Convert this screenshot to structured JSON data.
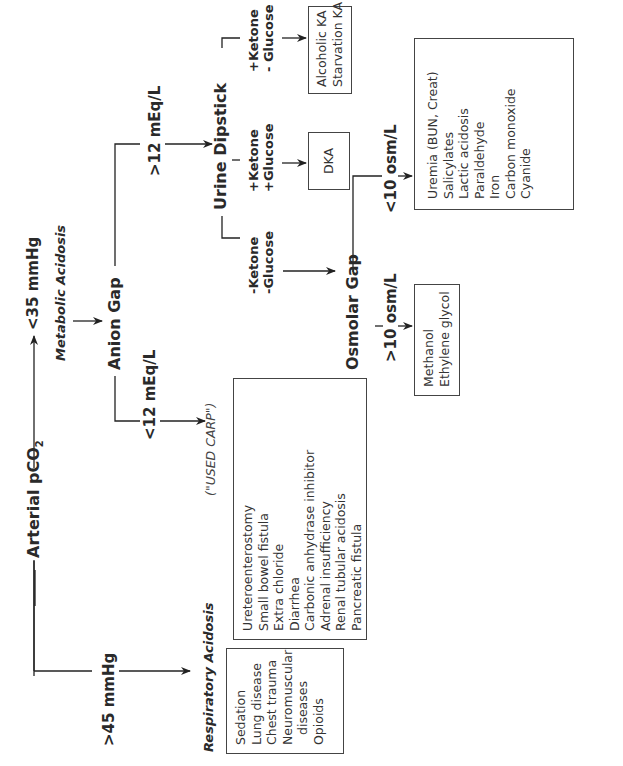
{
  "root": {
    "label": "Arterial  pCO",
    "subscript": "2"
  },
  "branches": {
    "high_pco2": {
      "label": ">45 mmHg",
      "result": "Respiratory Acidosis",
      "causes": [
        "Sedation",
        "Lung disease",
        "Chest trauma",
        "Neuromuscular",
        "  diseases",
        "Opioids"
      ]
    },
    "low_pco2": {
      "label": "<35 mmHg",
      "result": "Metabolic Acidosis"
    }
  },
  "anion_gap": {
    "label": "Anion Gap",
    "low": {
      "label": "<12 mEq/L",
      "mnemonic": "(\"USED CARP\")",
      "causes": [
        "Ureteroenterostomy",
        "Small bowel fistula",
        "Extra chloride",
        "Diarrhea",
        "Carbonic anhydrase inhibitor",
        "Adrenal insufficiency",
        "Renal tubular acidosis",
        "Pancreatic fistula"
      ]
    },
    "high": {
      "label": ">12 mEq/L"
    }
  },
  "urine_dipstick": {
    "label": "Urine Dipstick",
    "neg_neg": {
      "line1": "-Ketone",
      "line2": "-Glucose"
    },
    "pos_pos": {
      "line1": "+Ketone",
      "line2": "+Glucose",
      "result": "DKA"
    },
    "pos_neg": {
      "line1": "+Ketone",
      "line2": "- Glucose",
      "results": [
        "Alcoholic KA",
        "Starvation KA"
      ]
    }
  },
  "osmolar_gap": {
    "label": "Osmolar Gap",
    "high": {
      "label": ">10 osm/L",
      "causes": [
        "Methanol",
        "Ethylene glycol"
      ]
    },
    "low": {
      "label": "<10 osm/L",
      "causes": [
        "Uremia (BUN, Creat)",
        "Salicylates",
        "Lactic acidosis",
        "Paraldehyde",
        "Iron",
        "Carbon monoxide",
        "Cyanide"
      ]
    }
  }
}
